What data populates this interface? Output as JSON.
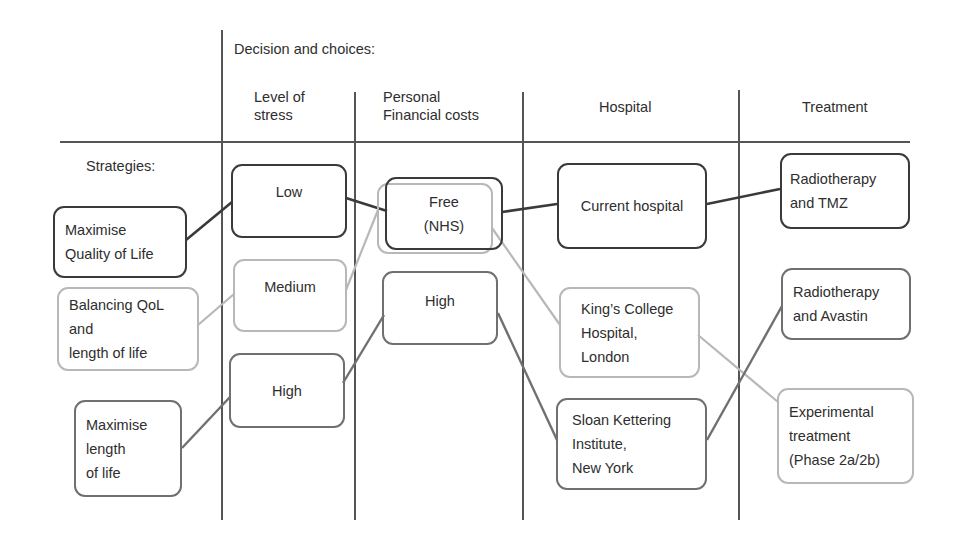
{
  "header": {
    "title": "Decision and choices:",
    "strategies_label": "Strategies:",
    "columns": [
      {
        "label": "Level of\nstress"
      },
      {
        "label": "Personal\nFinancial costs"
      },
      {
        "label": "Hospital"
      },
      {
        "label": "Treatment"
      }
    ]
  },
  "strategies": [
    {
      "label": "Maximise\nQuality of Life",
      "tone": "dark"
    },
    {
      "label": "Balancing QoL\nand\nlength of life",
      "tone": "light"
    },
    {
      "label": "Maximise\nlength\nof life",
      "tone": "mid"
    }
  ],
  "stress": [
    {
      "label": "Low",
      "tone": "dark"
    },
    {
      "label": "Medium",
      "tone": "light"
    },
    {
      "label": "High",
      "tone": "mid"
    }
  ],
  "costs": [
    {
      "label": "Free\n(NHS)",
      "tone": "dark+light"
    },
    {
      "label": "High",
      "tone": "mid"
    }
  ],
  "hospital": [
    {
      "label": "Current hospital",
      "tone": "dark"
    },
    {
      "label": "King’s College\nHospital,\nLondon",
      "tone": "light"
    },
    {
      "label": "Sloan Kettering\nInstitute,\nNew York",
      "tone": "mid"
    }
  ],
  "treatment": [
    {
      "label": "Radiotherapy\nand TMZ",
      "tone": "dark"
    },
    {
      "label": "Radiotherapy\nand Avastin",
      "tone": "mid"
    },
    {
      "label": "Experimental\ntreatment\n(Phase 2a/2b)",
      "tone": "light"
    }
  ],
  "colors": {
    "dark": "#3a3a3a",
    "mid": "#707070",
    "light": "#b8b8b8",
    "grid": "#555555"
  }
}
